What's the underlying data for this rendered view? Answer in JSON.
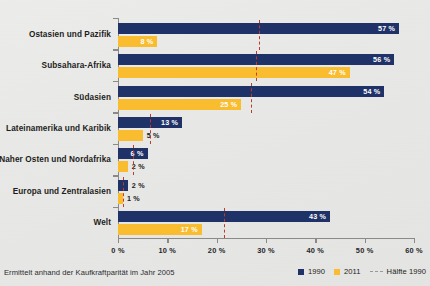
{
  "footnote": "Ermittelt anhand der Kaufkraftparität im Jahr 2005",
  "legend": {
    "items": [
      {
        "label": "1990",
        "color": "#1f3268",
        "marker": "square"
      },
      {
        "label": "2011",
        "color": "#fabd2f",
        "marker": "square"
      },
      {
        "label": "Hälfte 1990",
        "color": "#9a9a98",
        "marker": "dashed-line"
      }
    ]
  },
  "axis": {
    "x_ticklabels": [
      "0 %",
      "10 %",
      "20 %",
      "30 %",
      "40 %",
      "50 %",
      "60 %"
    ],
    "x_tickvalues": [
      0,
      10,
      20,
      30,
      40,
      50,
      60
    ]
  },
  "chart_data": {
    "type": "bar",
    "orientation": "horizontal",
    "title": "",
    "subtitle": "",
    "xlabel": "",
    "ylabel": "",
    "xlim": [
      0,
      60
    ],
    "grid": false,
    "legend_position": "bottom-right",
    "annotation": "Ermittelt anhand der Kaufkraftparität im Jahr 2005",
    "categories": [
      "Ostasien und Pazifik",
      "Subsahara-Afrika",
      "Südasien",
      "Lateinamerika und Karibik",
      "Naher Osten und Nordafrika",
      "Europa und Zentralasien",
      "Welt"
    ],
    "series": [
      {
        "name": "1990",
        "color": "#1f3268",
        "values": [
          57,
          56,
          54,
          13,
          6,
          2,
          43
        ],
        "labels": [
          "57 %",
          "56 %",
          "54 %",
          "13 %",
          "6 %",
          "2 %",
          "43 %"
        ]
      },
      {
        "name": "2011",
        "color": "#fabd2f",
        "values": [
          8,
          47,
          25,
          5,
          2,
          1,
          17
        ],
        "labels": [
          "8 %",
          "47 %",
          "25 %",
          "5 %",
          "2 %",
          "1 %",
          "17 %"
        ]
      }
    ],
    "reference_line": {
      "name": "Hälfte 1990",
      "color": "#c0392b",
      "style": "dashed",
      "values": [
        28.5,
        28.0,
        27.0,
        6.5,
        3.0,
        1.0,
        21.5
      ]
    }
  }
}
